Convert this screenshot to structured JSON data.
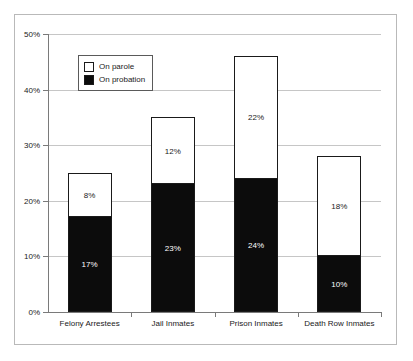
{
  "chart_data": {
    "type": "bar",
    "stacked": true,
    "title": "",
    "subtitle": "",
    "xlabel": "",
    "ylabel": "",
    "ylim": [
      0,
      50
    ],
    "ytick_labels": [
      "0%",
      "10%",
      "20%",
      "30%",
      "40%",
      "50%"
    ],
    "ytick_values": [
      0,
      10,
      20,
      30,
      40,
      50
    ],
    "grid": true,
    "legend_position": "top-left",
    "categories": [
      "Felony Arrestees",
      "Jail Inmates",
      "Prison Inmates",
      "Death Row Inmates"
    ],
    "series": [
      {
        "name": "On probation",
        "color": "#0c0c0c",
        "values": [
          17,
          23,
          24,
          10
        ],
        "data_labels": [
          "17%",
          "23%",
          "24%",
          "10%"
        ]
      },
      {
        "name": "On parole",
        "color": "#ffffff",
        "values": [
          8,
          12,
          22,
          18
        ],
        "data_labels": [
          "8%",
          "12%",
          "22%",
          "18%"
        ]
      }
    ],
    "totals": [
      25,
      35,
      46,
      28
    ]
  },
  "legend": {
    "items": [
      {
        "label": "On parole",
        "swatch": "white"
      },
      {
        "label": "On probation",
        "swatch": "black"
      }
    ]
  }
}
